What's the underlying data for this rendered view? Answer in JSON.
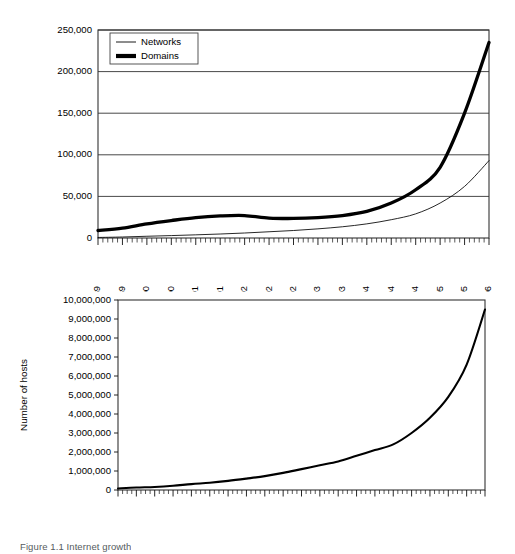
{
  "figure": {
    "caption": "Figure 1.1 Internet growth"
  },
  "chart_data": [
    {
      "id": "networks-domains",
      "type": "line",
      "title": "",
      "xlabel": "",
      "ylabel": "",
      "ylim": [
        0,
        250000
      ],
      "ytick_values": [
        0,
        50000,
        100000,
        150000,
        200000,
        250000
      ],
      "ytick_labels": [
        "0",
        "50,000",
        "100,000",
        "150,000",
        "200,000",
        "250,000"
      ],
      "grid": true,
      "legend_position": "upper-left",
      "x_tick_label_step": 5,
      "x_tick_count": 81,
      "xtick_labels": [
        "7/89",
        "12/89",
        "5/90",
        "10/90",
        "3/91",
        "8/91",
        "1/92",
        "6/92",
        "11/92",
        "4/93",
        "9/93",
        "2/94",
        "7/94",
        "12/94",
        "5/95",
        "10/95",
        "3/96"
      ],
      "x": [
        "7/89",
        "12/89",
        "5/90",
        "10/90",
        "3/91",
        "8/91",
        "1/92",
        "6/92",
        "11/92",
        "4/93",
        "9/93",
        "2/94",
        "7/94",
        "12/94",
        "5/95",
        "10/95",
        "3/96"
      ],
      "series": [
        {
          "name": "Networks",
          "style": "thin",
          "values": [
            650,
            1200,
            2100,
            2900,
            3800,
            4800,
            6000,
            7500,
            9000,
            11000,
            13500,
            17000,
            22000,
            29000,
            42000,
            62000,
            93000
          ]
        },
        {
          "name": "Domains",
          "style": "thick",
          "values": [
            9000,
            12000,
            17000,
            21000,
            24500,
            26500,
            27000,
            24000,
            23500,
            24500,
            27000,
            32000,
            42000,
            58000,
            85000,
            150000,
            235000
          ]
        }
      ]
    },
    {
      "id": "number-of-hosts",
      "type": "line",
      "title": "",
      "xlabel": "",
      "ylabel": "Number of hosts",
      "ylim": [
        0,
        10000000
      ],
      "ytick_values": [
        0,
        1000000,
        2000000,
        3000000,
        4000000,
        5000000,
        6000000,
        7000000,
        8000000,
        9000000,
        10000000
      ],
      "ytick_labels": [
        "0",
        "1,000,000",
        "2,000,000",
        "3,000,000",
        "4,000,000",
        "5,000,000",
        "6,000,000",
        "7,000,000",
        "8,000,000",
        "9,000,000",
        "10,000,000"
      ],
      "grid": false,
      "legend_position": "none",
      "x_tick_label_step": 4,
      "x_tick_count": 81,
      "xtick_labels": [
        "3/89",
        "7/89",
        "11/89",
        "3/90",
        "7/90",
        "11/90",
        "3/91",
        "7/91",
        "11/91",
        "3/92",
        "7/92",
        "11/92",
        "3/93",
        "7/93",
        "11/93",
        "3/94",
        "7/94",
        "11/94",
        "3/95",
        "7/95",
        "11/95"
      ],
      "x": [
        "3/89",
        "7/89",
        "11/89",
        "3/90",
        "7/90",
        "11/90",
        "3/91",
        "7/91",
        "11/91",
        "3/92",
        "7/92",
        "11/92",
        "3/93",
        "7/93",
        "11/93",
        "3/94",
        "7/94",
        "11/94",
        "3/95",
        "7/95",
        "11/95"
      ],
      "series": [
        {
          "name": "Number of hosts",
          "style": "host",
          "values": [
            80000,
            130000,
            160000,
            220000,
            310000,
            380000,
            480000,
            600000,
            730000,
            900000,
            1100000,
            1300000,
            1500000,
            1800000,
            2100000,
            2400000,
            3000000,
            3800000,
            4900000,
            6600000,
            9500000
          ]
        }
      ]
    }
  ]
}
